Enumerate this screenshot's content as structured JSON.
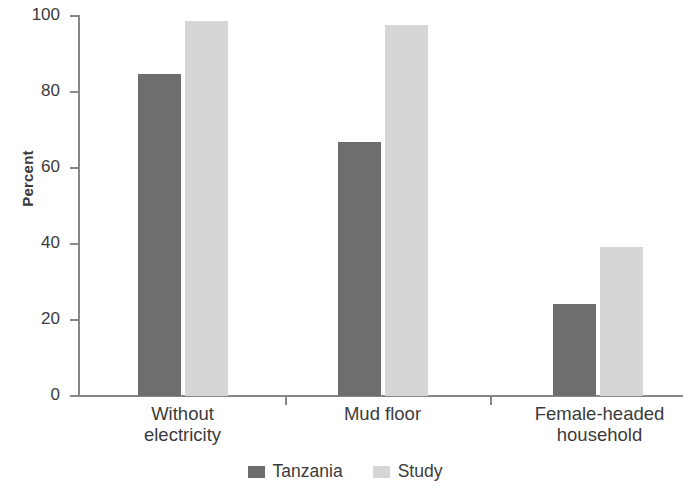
{
  "chart_data": {
    "type": "bar",
    "title": "",
    "subtitle": "",
    "xlabel": "",
    "ylabel": "Percent",
    "ylim": [
      0,
      100
    ],
    "yticks": [
      0,
      20,
      40,
      60,
      80,
      100
    ],
    "ytick_labels": [
      "0",
      "20",
      "40",
      "60",
      "80",
      "100"
    ],
    "grid": false,
    "legend_position": "bottom-center",
    "categories": [
      "Without electricity",
      "Mud floor",
      "Female-headed household"
    ],
    "category_lines": [
      [
        "Without",
        "electricity"
      ],
      [
        "Mud floor"
      ],
      [
        "Female-headed",
        "household"
      ]
    ],
    "series": [
      {
        "name": "Tanzania",
        "color": "#6e6e6e",
        "values": [
          84.5,
          66.7,
          24.2
        ]
      },
      {
        "name": "Study",
        "color": "#d6d6d6",
        "values": [
          98.4,
          97.5,
          39.2
        ]
      }
    ]
  },
  "axis": {
    "y_label": "Percent",
    "tick_0": "0",
    "tick_20": "20",
    "tick_40": "40",
    "tick_60": "60",
    "tick_80": "80",
    "tick_100": "100"
  },
  "categories": {
    "c0_line0": "Without",
    "c0_line1": "electricity",
    "c1_line0": "Mud floor",
    "c1_line1": "",
    "c2_line0": "Female-headed",
    "c2_line1": "household"
  },
  "legend": {
    "item0_label": "Tanzania",
    "item0_color": "#6e6e6e",
    "item1_label": "Study",
    "item1_color": "#d6d6d6"
  }
}
